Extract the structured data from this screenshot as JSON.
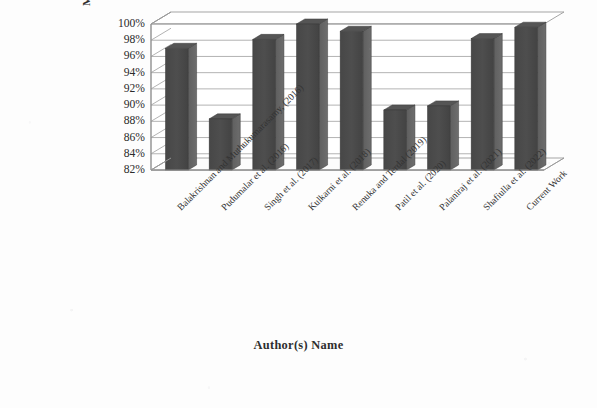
{
  "chart_data": {
    "type": "bar",
    "title": "",
    "subtitle": "",
    "xlabel": "Author(s) Name",
    "ylabel": "Maximum Accuracy Obtained",
    "categories": [
      "Balakrishnan and Muthukumarasamy, (2016)",
      "Pudumalar et al. (2016)",
      "Singh et al. (2017)",
      "Kulkarni et al. (2018)",
      "Renuka and Terdal (2019)",
      "Patil et al. (2020)",
      "Palaniraj et al. (2021)",
      "Shafiulla et al. (2022)",
      "Current Work"
    ],
    "values": [
      97.0,
      88.3,
      98.1,
      100.0,
      99.1,
      89.4,
      89.9,
      98.2,
      99.6
    ],
    "value_labels": [
      "97%",
      "88.3%",
      "98.1%",
      "100%",
      "99.1%",
      "89.4%",
      "89.9%",
      "98.2%",
      "99.6%"
    ],
    "ylim": [
      82,
      100
    ],
    "ytick_values": [
      82,
      84,
      86,
      88,
      90,
      92,
      94,
      96,
      98,
      100
    ],
    "ytick_labels": [
      "82%",
      "84%",
      "86%",
      "88%",
      "90%",
      "92%",
      "94%",
      "96%",
      "98%",
      "100%"
    ],
    "grid": true,
    "grid_axis": "y",
    "legend": false,
    "legend_position": "none",
    "series": [
      {
        "name": "Maximum Accuracy Obtained",
        "color": "#4a4a4a",
        "values": [
          97.0,
          88.3,
          98.1,
          100.0,
          99.1,
          89.4,
          89.9,
          98.2,
          99.6
        ]
      }
    ],
    "style": "3d-clustered-column",
    "bar_color": "#4a4a4a",
    "bar_side_color": "#636363",
    "bar_top_color": "#555555",
    "plot_background": "#ffffff",
    "axis_color": "#8f8f8f",
    "gridline_color": "#9a9a9a",
    "annotations": []
  }
}
